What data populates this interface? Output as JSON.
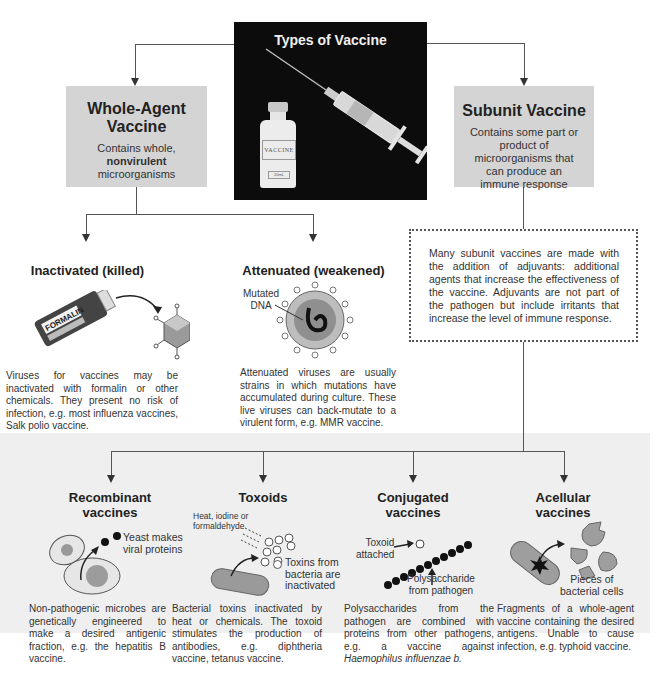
{
  "title": "Types of Vaccine",
  "whole_agent": {
    "title_line1": "Whole-Agent",
    "title_line2": "Vaccine",
    "desc_prefix": "Contains whole, ",
    "desc_bold": "nonvirulent",
    "desc_suffix": "microorganisms"
  },
  "subunit": {
    "title": "Subunit Vaccine",
    "desc": "Contains some part or product of microorganisms that can produce an immune response",
    "adjuvant_note": "Many subunit vaccines are made with the addition of adjuvants: additional agents that increase the effectiveness of the vaccine. Adjuvants are not part of the pathogen but include irritants that increase the level of immune response."
  },
  "photo": {
    "vial_label": "VACCINE",
    "vial_sublabel": "20mL"
  },
  "inactivated": {
    "title": "Inactivated (killed)",
    "bottle_label": "FORMALIN",
    "desc": "Viruses for vaccines may be inactivated with formalin or other chemicals. They present no risk of infection, e.g. most influenza vaccines, Salk polio vaccine."
  },
  "attenuated": {
    "title": "Attenuated (weakened)",
    "label_line1": "Mutated",
    "label_line2": "DNA",
    "desc": "Attenuated viruses are usually strains in which mutations have accumulated during culture. These live viruses can back-mutate to a virulent form, e.g. MMR vaccine."
  },
  "subtypes": [
    {
      "title_line1": "Recombinant",
      "title_line2": "vaccines",
      "label_line1": "Yeast makes",
      "label_line2": "viral proteins",
      "desc": "Non-pathogenic microbes are genetically engineered to make a desired antigenic fraction, e.g. the hepatitis B vaccine."
    },
    {
      "title_line1": "Toxoids",
      "label_top_line1": "Heat, iodine or",
      "label_top_line2": "formaldehyde",
      "label_line1": "Toxins from",
      "label_line2": "bacteria are",
      "label_line3": "inactivated",
      "desc": "Bacterial toxins inactivated by heat or chemicals. The toxoid stimulates the production of antibodies, e.g. diphtheria vaccine, tetanus vaccine."
    },
    {
      "title_line1": "Conjugated",
      "title_line2": "vaccines",
      "label_top_line1": "Toxoid",
      "label_top_line2": "attached",
      "label_line1": "Polysaccharide",
      "label_line2": "from pathogen",
      "desc_prefix": "Polysaccharides from the pathogen are combined with proteins from other pathogens, e.g. a vaccine against ",
      "desc_italic": "Haemophilus influenzae b."
    },
    {
      "title_line1": "Acellular",
      "title_line2": "vaccines",
      "label_line1": "Pieces of",
      "label_line2": "bacterial cells",
      "desc": "Fragments of a whole-agent vaccine containing the desired antigens. Unable to cause infection, e.g. typhoid vaccine."
    }
  ],
  "colors": {
    "gray_box": "#d4d4d4",
    "dark_panel": "#0c0c0c",
    "bottom_panel": "#efefef",
    "line": "#555555"
  }
}
